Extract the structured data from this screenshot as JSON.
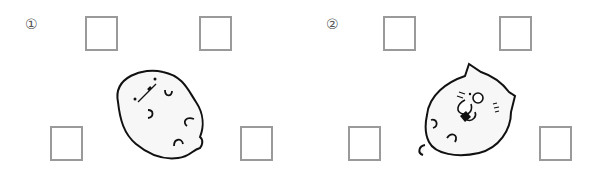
{
  "panels": [
    {
      "number": "①",
      "character": "round-blob-creature",
      "answer_boxes": [
        "",
        "",
        "",
        ""
      ]
    },
    {
      "number": "②",
      "character": "cat-creature",
      "answer_boxes": [
        "",
        "",
        "",
        ""
      ]
    }
  ],
  "colors": {
    "box_border": "#9a9a9a",
    "outline": "#111111",
    "fill": "#f7f7f7"
  }
}
